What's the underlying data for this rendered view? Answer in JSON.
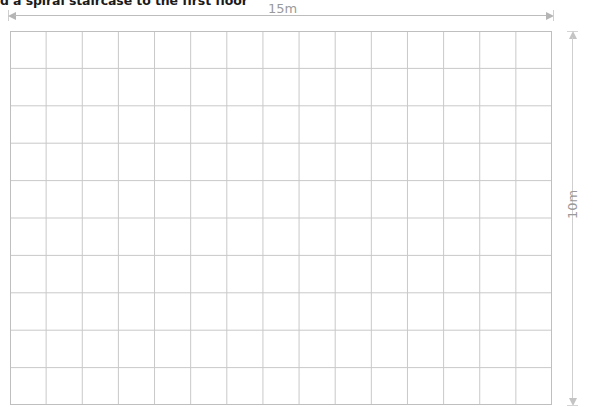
{
  "page": {
    "heading": "d a spiral staircase to the first floor",
    "background_color": "#ffffff"
  },
  "diagram": {
    "name": "floor-plan-grid",
    "grid": {
      "columns": 15,
      "rows": 10,
      "line_color": "#c9c9c9",
      "border_color": "#bfbfbf",
      "cell_width_px": 36.13,
      "cell_height_px": 37.4
    },
    "dimensions": {
      "width_label": "15m",
      "height_label": "10m",
      "label_color": "#9a9a9a",
      "arrow_color": "#bdbdbd"
    }
  }
}
